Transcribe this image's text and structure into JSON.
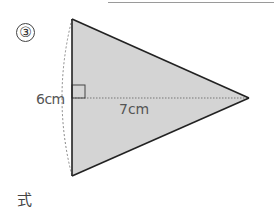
{
  "header": {
    "rule": "answer-line"
  },
  "problem": {
    "number": "③",
    "height_label": "6cm",
    "base_label": "7cm",
    "formula_label": "式"
  },
  "figure": {
    "shape": "kite-triangle",
    "fill_color": "#d4d4d4",
    "stroke_color": "#222222",
    "vertices": {
      "top": [
        72,
        19
      ],
      "bottom": [
        72,
        176
      ],
      "right": [
        249,
        98
      ]
    },
    "height_cm": 6,
    "base_cm": 7
  }
}
